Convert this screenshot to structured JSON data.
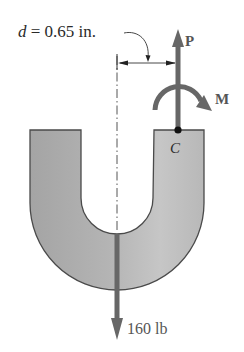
{
  "figure": {
    "dimension_label": {
      "symbol": "d",
      "equals": " = ",
      "value": "0.65 in."
    },
    "force_up": {
      "label": "P"
    },
    "moment": {
      "label": "M"
    },
    "point": {
      "label": "C"
    },
    "force_down": {
      "label": "160 lb"
    }
  },
  "colors": {
    "body_fill_dark": "#a6a6a6",
    "body_fill_light": "#c4c4c4",
    "body_outline": "#4a4a4a",
    "arrow": "#676767",
    "text": "#2a2a2a",
    "point": "#111111"
  }
}
